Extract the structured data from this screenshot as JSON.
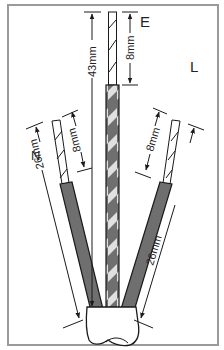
{
  "diagram": {
    "labels": {
      "earth": "E",
      "live": "L",
      "neutral": "N"
    },
    "dimensions": {
      "earth_total": "43mm",
      "earth_strip": "8mm",
      "neutral_total": "26mm",
      "neutral_strip": "8mm",
      "live_total": "26mm",
      "live_strip": "8mm"
    },
    "colors": {
      "frame": "#9a9a9a",
      "insulation": "#6f6f6f",
      "stripe_light": "#e0e0e0",
      "line": "#1a1a1a"
    }
  }
}
